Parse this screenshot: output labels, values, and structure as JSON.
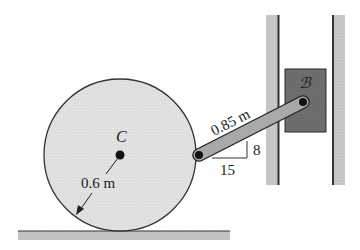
{
  "figure": {
    "labels": {
      "center": "C",
      "block": "ℬ",
      "link_length": "0.85 m",
      "radius": "0.6 m",
      "slope_rise": "8",
      "slope_run": "15"
    },
    "colors": {
      "wheel_fill": "#e2e2e2",
      "wheel_stroke": "#333333",
      "ground_fill": "#c4c4c4",
      "wall_fill": "#c8c8c8",
      "block_fill": "#6e6e6e",
      "link_fill": "#a9a9a9",
      "pin": "#111111"
    }
  }
}
